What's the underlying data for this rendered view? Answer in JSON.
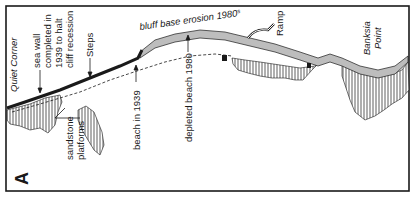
{
  "figure": {
    "panel_label": "A",
    "colors": {
      "ink": "#1a1a1a",
      "bluff_fill": "#bdbdbd",
      "background": "#ffffff"
    }
  },
  "labels": {
    "quiet_corner": "Quiet Corner",
    "sea_wall_line1": "sea wall",
    "sea_wall_line2": "completed in",
    "sea_wall_line3": "1939 to halt",
    "sea_wall_line4": "cliff recession",
    "steps": "Steps",
    "bluff_erosion": "bluff base erosion 1980",
    "bluff_erosion_sup": "s",
    "ramp": "Ramp",
    "banksia_line1": "Banksia",
    "banksia_line2": "Point",
    "beach_1939": "beach in 1939",
    "depleted_beach": "depleted beach 1980",
    "sandstone_line1": "sandstone",
    "sandstone_line2": "platforms"
  },
  "legend_features": [
    {
      "name": "sea wall",
      "style": "thick black line"
    },
    {
      "name": "bluff",
      "style": "stippled grey band"
    },
    {
      "name": "beach in 1939",
      "style": "dashed line"
    },
    {
      "name": "sandstone platforms",
      "style": "vertical hatching"
    }
  ]
}
